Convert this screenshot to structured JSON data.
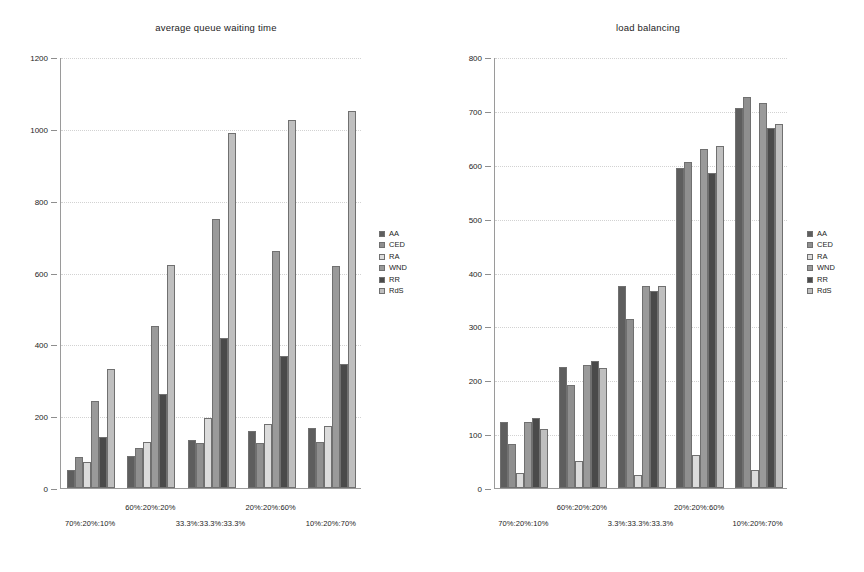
{
  "chart_data": [
    {
      "type": "bar",
      "title": "average queue waiting time",
      "xlabel": "",
      "ylabel": "",
      "ylim": [
        0,
        1200
      ],
      "yticks": [
        0,
        200,
        400,
        600,
        800,
        1000,
        1200
      ],
      "grid": true,
      "legend_position": "right",
      "categories": [
        "70%:20%:10%",
        "60%:20%:20%",
        "33.3%:33.3%:33.3%",
        "20%:20%:60%",
        "10%:20%:70%"
      ],
      "series": [
        {
          "name": "AA",
          "values": [
            50,
            88,
            133,
            158,
            168
          ]
        },
        {
          "name": "CED",
          "values": [
            85,
            112,
            125,
            125,
            128
          ]
        },
        {
          "name": "RA",
          "values": [
            72,
            128,
            195,
            178,
            172
          ]
        },
        {
          "name": "WND",
          "values": [
            243,
            450,
            748,
            660,
            618
          ]
        },
        {
          "name": "RR",
          "values": [
            142,
            262,
            418,
            368,
            345
          ]
        },
        {
          "name": "RdS",
          "values": [
            332,
            620,
            988,
            1025,
            1050
          ]
        }
      ]
    },
    {
      "type": "bar",
      "title": "load balancing",
      "xlabel": "",
      "ylabel": "",
      "ylim": [
        0,
        800
      ],
      "yticks": [
        0,
        100,
        200,
        300,
        400,
        500,
        600,
        700,
        800
      ],
      "grid": true,
      "legend_position": "right",
      "categories": [
        "70%:20%:10%",
        "60%:20%:20%",
        "3.3%:33.3%:33.3%",
        "20%:20%:60%",
        "10%:20%:70%"
      ],
      "series": [
        {
          "name": "AA",
          "values": [
            122,
            225,
            375,
            594,
            705
          ]
        },
        {
          "name": "CED",
          "values": [
            82,
            192,
            314,
            605,
            725
          ]
        },
        {
          "name": "RA",
          "values": [
            27,
            50,
            25,
            62,
            33
          ]
        },
        {
          "name": "WND",
          "values": [
            123,
            228,
            375,
            630,
            715
          ]
        },
        {
          "name": "RR",
          "values": [
            130,
            235,
            365,
            585,
            668
          ]
        },
        {
          "name": "RdS",
          "values": [
            110,
            222,
            375,
            635,
            675
          ]
        }
      ]
    }
  ],
  "legend": {
    "items": [
      {
        "label": "AA"
      },
      {
        "label": "CED"
      },
      {
        "label": "RA"
      },
      {
        "label": "WND"
      },
      {
        "label": "RR"
      },
      {
        "label": "RdS"
      }
    ]
  },
  "colors": {
    "AA": "#5e5e5e",
    "CED": "#8f8f8f",
    "RA": "#dcdcdc",
    "WND": "#9a9a9a",
    "RR": "#4a4a4a",
    "RdS": "#bfbfbf",
    "axis": "#9a9a9a",
    "grid": "#d2d2d2",
    "text": "#1d1d1d",
    "background": "#ffffff"
  }
}
